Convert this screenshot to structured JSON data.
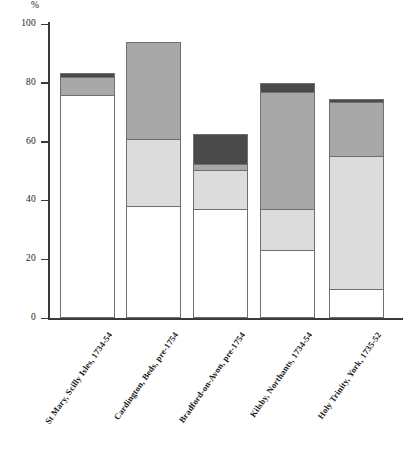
{
  "chart_data": {
    "type": "bar",
    "subtype": "stacked-bar",
    "title": "",
    "xlabel": "",
    "ylabel": "%",
    "ylim": [
      0,
      100
    ],
    "yticks": [
      0,
      20,
      40,
      60,
      80,
      100
    ],
    "ytick_labels": [
      "0",
      "20",
      "40",
      "60",
      "80",
      "100"
    ],
    "grid": false,
    "legend": "none",
    "categories": [
      "St Mary, Scilly Isles, 1734-54",
      "Cardington, Beds, pre-1754",
      "Bradford-on-Avon, pre-1754",
      "Kilsby, Northants, 1734-54",
      "Holy Trinity, York, 1735-52"
    ],
    "series": [
      {
        "name": "segment-1",
        "color": "#ffffff",
        "values": [
          76.0,
          38.0,
          37.0,
          23.0,
          10.0
        ]
      },
      {
        "name": "segment-2",
        "color": "#dcdcdc",
        "values": [
          0.0,
          23.0,
          13.5,
          14.0,
          45.0
        ]
      },
      {
        "name": "segment-3",
        "color": "#a8a8a8",
        "values": [
          6.0,
          33.0,
          2.0,
          40.0,
          18.5
        ]
      },
      {
        "name": "segment-4",
        "color": "#4a4a4a",
        "values": [
          1.5,
          0.0,
          10.0,
          3.0,
          1.0
        ]
      }
    ],
    "totals": [
      83.5,
      94.0,
      62.5,
      80.0,
      74.5
    ],
    "bar_border_color": "#6f6f6f",
    "axis_color": "#3a3a3a"
  }
}
